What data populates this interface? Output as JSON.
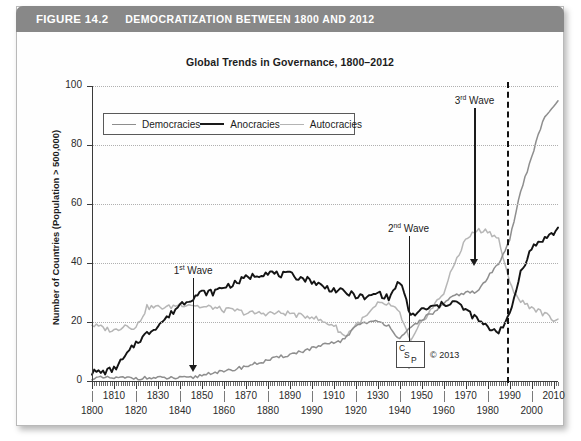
{
  "figure": {
    "number": "FIGURE 14.2",
    "title": "DEMOCRATIZATION BETWEEN 1800 AND 2012"
  },
  "chart_title": "Global Trends in Governance, 1800–2012",
  "legend": {
    "position": "inside-top-left",
    "items": [
      {
        "label": "Democracies",
        "color": "#8e8e8e"
      },
      {
        "label": "Anocracies",
        "color": "#141414"
      },
      {
        "label": "Autocracies",
        "color": "#b6b6b6"
      }
    ]
  },
  "annotations": {
    "wave1": {
      "prefix": "1",
      "suffix": "st",
      "text": " Wave",
      "year": 1846
    },
    "wave2": {
      "prefix": "2",
      "suffix": "nd",
      "text": " Wave",
      "year": 1944
    },
    "wave3": {
      "prefix": "3",
      "suffix": "rd",
      "text": " Wave",
      "year": 1974
    },
    "event_line_year": 1989,
    "copyright": "© 2013",
    "logo": {
      "c": "C",
      "s": "S",
      "p": "P"
    }
  },
  "chart_data": {
    "type": "line",
    "title": "Global Trends in Governance, 1800–2012",
    "xlabel": "",
    "ylabel": "Number of Countries (Population > 500,000)",
    "xlim": [
      1800,
      2012
    ],
    "ylim": [
      0,
      100
    ],
    "grid": true,
    "ytick_labels": [
      "0",
      "20",
      "40",
      "60",
      "80",
      "100"
    ],
    "ytick_values": [
      0,
      20,
      40,
      60,
      80,
      100
    ],
    "xtick_values_top_row": [
      1810,
      1830,
      1850,
      1870,
      1890,
      1910,
      1930,
      1950,
      1970,
      1990,
      2010
    ],
    "xtick_labels_top_row": [
      "1810",
      "1830",
      "1850",
      "1870",
      "1890",
      "1910",
      "1930",
      "1950",
      "1970",
      "1990",
      "2010"
    ],
    "xtick_values_bottom_row": [
      1800,
      1820,
      1840,
      1860,
      1880,
      1900,
      1920,
      1940,
      1960,
      1980,
      2000
    ],
    "xtick_labels_bottom_row": [
      "1800",
      "1820",
      "1840",
      "1860",
      "1880",
      "1990",
      "1920",
      "1940",
      "1960",
      "1980",
      "2000"
    ],
    "x": [
      1800,
      1805,
      1810,
      1815,
      1820,
      1825,
      1830,
      1835,
      1840,
      1845,
      1850,
      1855,
      1860,
      1865,
      1870,
      1875,
      1880,
      1885,
      1890,
      1895,
      1900,
      1905,
      1910,
      1915,
      1920,
      1925,
      1930,
      1935,
      1940,
      1945,
      1950,
      1955,
      1960,
      1965,
      1970,
      1975,
      1980,
      1985,
      1990,
      1995,
      2000,
      2005,
      2010,
      2012
    ],
    "series": [
      {
        "name": "Autocracies",
        "color": "#b6b6b6",
        "values": [
          19,
          18,
          17,
          19,
          18,
          25,
          25,
          25,
          26,
          26,
          25,
          25,
          24,
          24,
          23,
          23,
          23,
          23,
          23,
          22,
          22,
          20,
          19,
          15,
          19,
          22,
          26,
          26,
          23,
          13,
          20,
          25,
          30,
          40,
          48,
          51,
          51,
          48,
          33,
          27,
          25,
          23,
          21,
          21
        ],
        "note": "starts ~19, plateau ~25 mid-1800s, dips in 1940s, peaks ~51 in late 1970s, collapses after 1989 to ~21"
      },
      {
        "name": "Anocracies",
        "color": "#141414",
        "values": [
          3,
          3,
          4,
          8,
          13,
          16,
          19,
          22,
          26,
          28,
          30,
          30,
          32,
          33,
          35,
          36,
          37,
          36,
          36,
          35,
          34,
          32,
          31,
          30,
          29,
          28,
          30,
          28,
          34,
          22,
          24,
          25,
          26,
          27,
          24,
          21,
          18,
          17,
          22,
          37,
          45,
          48,
          50,
          52
        ],
        "note": "rises 1800-1880 to ~37, gentle decline, spike ~34 in 1940, trough ~17 in 1985, sharp rise after 1989 to ~52"
      },
      {
        "name": "Democracies",
        "color": "#8e8e8e",
        "values": [
          1,
          1,
          1,
          1,
          1,
          1,
          1,
          1,
          1,
          1,
          2,
          3,
          3,
          4,
          5,
          6,
          7,
          8,
          9,
          10,
          11,
          12,
          13,
          14,
          19,
          20,
          20,
          19,
          14,
          18,
          21,
          23,
          26,
          29,
          30,
          30,
          35,
          40,
          48,
          64,
          76,
          88,
          93,
          95
        ],
        "note": "near zero until 1850, slow rise, jumps after WWI and WWII, steep third-wave climb after 1989 to ~95"
      }
    ]
  }
}
